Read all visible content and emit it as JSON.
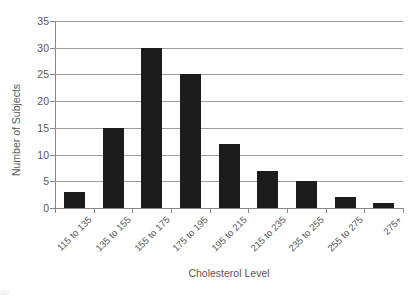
{
  "chart_data": {
    "type": "bar",
    "title": "",
    "xlabel": "Cholesterol Level",
    "ylabel": "Number of Subjects",
    "categories": [
      "115 to 135",
      "135 to 155",
      "155 to 175",
      "175 to 195",
      "195 to 215",
      "215 to 235",
      "235 to 255",
      "255 to 275",
      "275+"
    ],
    "values": [
      3,
      15,
      30,
      25,
      12,
      7,
      5,
      2,
      1
    ],
    "ylim": [
      0,
      35
    ],
    "yticks": [
      0,
      5,
      10,
      15,
      20,
      25,
      30,
      35
    ],
    "grid": "horizontal",
    "legend": "none",
    "colors": {
      "bar": "#1c1c1c",
      "gridline": "#9e9e9e",
      "axis": "#868686",
      "text": "#585858",
      "background": "#ffffff"
    }
  }
}
